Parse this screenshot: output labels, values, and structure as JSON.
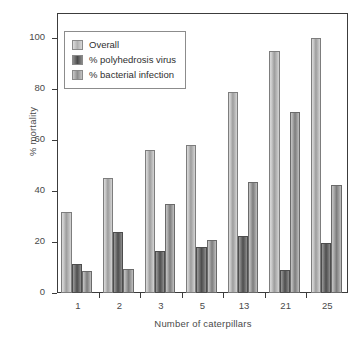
{
  "chart_data": {
    "type": "bar",
    "title": "",
    "xlabel": "Number of caterpillars",
    "ylabel": "% mortality",
    "categories": [
      "1",
      "2",
      "3",
      "5",
      "13",
      "21",
      "25"
    ],
    "ylim": [
      0,
      110
    ],
    "yticks": [
      0,
      20,
      40,
      60,
      80,
      100
    ],
    "ytick_labels": [
      "0",
      "20",
      "40",
      "60",
      "80",
      "100"
    ],
    "grid": false,
    "legend_position": "upper-left",
    "series": [
      {
        "name": "Overall",
        "color": "#b0b0b0",
        "values": [
          32,
          45,
          56,
          58,
          79,
          95,
          100
        ]
      },
      {
        "name": "% polyhedrosis virus",
        "color": "#4a4a4a",
        "values": [
          11.5,
          24,
          16.5,
          18,
          22.5,
          9,
          19.5
        ]
      },
      {
        "name": "% bacterial infection",
        "color": "#8d8d8d",
        "values": [
          8.5,
          9.5,
          35,
          21,
          43.5,
          71,
          42.5
        ]
      }
    ]
  },
  "legend": {
    "items": [
      {
        "label": "Overall"
      },
      {
        "label": "% polyhedrosis virus"
      },
      {
        "label": "% bacterial infection"
      }
    ]
  }
}
